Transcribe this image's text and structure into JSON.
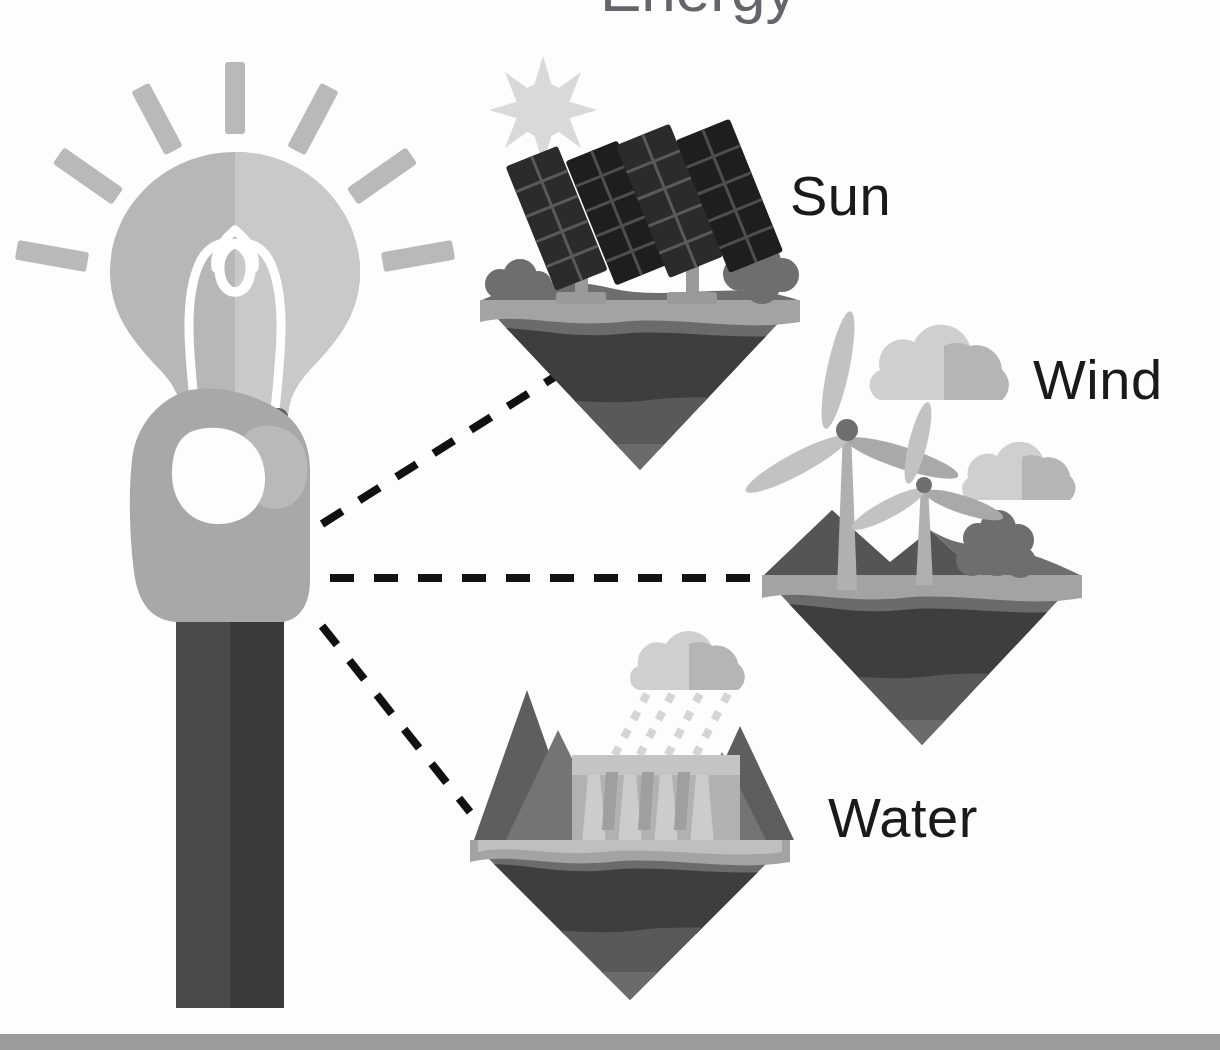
{
  "page": {
    "title_remnant": "Energy",
    "width": 1220,
    "height": 1050,
    "background_color": "#fdfdfd"
  },
  "labels": {
    "sun": "Sun",
    "wind": "Wind",
    "water": "Water"
  },
  "palette": {
    "background": "#fdfdfd",
    "text": "#1a1a1a",
    "dashed_line": "#111111",
    "bottom_bar": "#9b9b9b",
    "bulb_glass_left": "#b7b7b7",
    "bulb_glass_right": "#c9c9c9",
    "bulb_filament": "#ffffff",
    "bulb_base_dark": "#3b3b3b",
    "bulb_base_mid": "#5d5d5d",
    "ray_gray": "#b9b9b9",
    "hand_skin": "#a8a8a8",
    "hand_skin_light": "#b9b9b9",
    "sleeve_dark": "#4a4a4a",
    "sleeve_darker": "#3a3a3a",
    "panel_dark": "#2b2b2b",
    "panel_darker": "#1e1e1e",
    "panel_line": "#5a5a5a",
    "post_gray": "#9a9a9a",
    "sun_disc": "#d9d9d9",
    "cloud_light": "#cfcfcf",
    "cloud_mid": "#b5b5b5",
    "turbine_blade": "#c2c2c2",
    "turbine_blade_dark": "#a9a9a9",
    "turbine_tower": "#b0b0b0",
    "bush_dark": "#6e6e6e",
    "ground_surface": "#a3a3a3",
    "hill_dark": "#555555",
    "soil_top": "#9c9c9c",
    "soil_dark": "#3e3e3e",
    "soil_mid": "#595959",
    "soil_low": "#6b6b6b",
    "mountain": "#5e5e5e",
    "mountain_light": "#747474",
    "dam_wall": "#b2b2b2",
    "dam_spill": "#cccccc",
    "rain_drop": "#d5d5d5"
  },
  "diagram": {
    "type": "radial-concept-diagram",
    "center_node": {
      "name": "hand-holding-lightbulb",
      "description": "A hand holding a glowing light bulb with radiating rays"
    },
    "connector_style": "black dashed line",
    "nodes": [
      {
        "id": "sun",
        "label": "Sun",
        "icon": "solar-panel-island",
        "elements": [
          "sun",
          "solar-panels",
          "bushes",
          "island"
        ],
        "panel_count": 4
      },
      {
        "id": "wind",
        "label": "Wind",
        "icon": "wind-turbine-island",
        "elements": [
          "clouds",
          "wind-turbines",
          "bush",
          "hills",
          "island"
        ],
        "turbine_count": 2,
        "cloud_count": 2
      },
      {
        "id": "water",
        "label": "Water",
        "icon": "hydro-dam-island",
        "elements": [
          "rain-cloud",
          "rain",
          "mountains",
          "dam",
          "island"
        ],
        "mountain_count": 4,
        "spillway_count": 4
      }
    ]
  }
}
